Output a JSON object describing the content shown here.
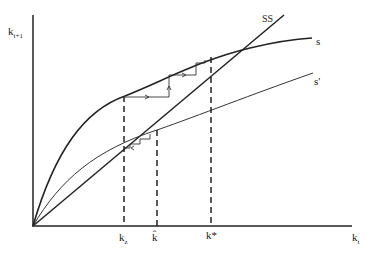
{
  "diagram": {
    "y_axis_label": "k",
    "y_axis_sub": "t+1",
    "x_axis_label": "k",
    "x_axis_sub": "t",
    "curves": {
      "ss_label": "SS",
      "s_label": "s",
      "s_prime_label": "s'"
    },
    "x_ticks": {
      "kz": "k",
      "kz_sub": "z",
      "khat": "k̂",
      "kstar": "k*"
    }
  }
}
